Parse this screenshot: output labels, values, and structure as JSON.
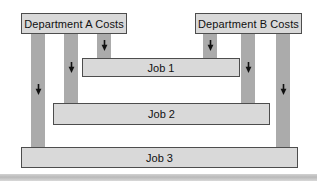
{
  "diagram": {
    "type": "job-costing-flow",
    "departments": [
      {
        "id": "dept-a",
        "label": "Department A Costs"
      },
      {
        "id": "dept-b",
        "label": "Department B Costs"
      }
    ],
    "jobs": [
      {
        "id": "job-1",
        "label": "Job 1"
      },
      {
        "id": "job-2",
        "label": "Job 2"
      },
      {
        "id": "job-3",
        "label": "Job 3"
      }
    ],
    "flows": [
      {
        "from": "Department A Costs",
        "to": "Job 1"
      },
      {
        "from": "Department A Costs",
        "to": "Job 2"
      },
      {
        "from": "Department A Costs",
        "to": "Job 3"
      },
      {
        "from": "Department B Costs",
        "to": "Job 1"
      },
      {
        "from": "Department B Costs",
        "to": "Job 2"
      },
      {
        "from": "Department B Costs",
        "to": "Job 3"
      }
    ],
    "colors": {
      "background": "#ffffff",
      "pipe": "#ababab",
      "box_fill": "#d9d9d9",
      "box_border": "#4d4d4d",
      "arrow": "#111111",
      "divider": "#c2c2c2",
      "text": "#111111"
    }
  }
}
